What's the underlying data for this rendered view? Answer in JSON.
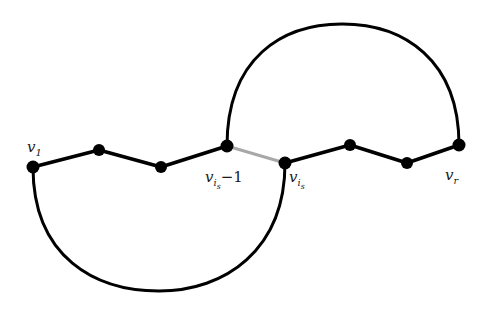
{
  "figure": {
    "background_color": "#ffffff",
    "width": 488,
    "height": 316,
    "edge_color": "#000000",
    "arc_color": "#000000",
    "highlight_edge_color": "#a8a8a8",
    "vertex_color": "#000000",
    "label_color": "#1a1a1a"
  },
  "vertices": [
    {
      "id": "v1",
      "x": 33,
      "y": 167,
      "r": 6.5,
      "label": "v",
      "sub": "1",
      "sub2": "",
      "tail": "",
      "label_x": 27,
      "label_y": 152,
      "labelled": true
    },
    {
      "id": "v2",
      "x": 99,
      "y": 150,
      "r": 6.0,
      "label": "",
      "sub": "",
      "sub2": "",
      "tail": "",
      "label_x": 0,
      "label_y": 0,
      "labelled": false
    },
    {
      "id": "v3",
      "x": 161,
      "y": 167,
      "r": 6.0,
      "label": "",
      "sub": "",
      "sub2": "",
      "tail": "",
      "label_x": 0,
      "label_y": 0,
      "labelled": false
    },
    {
      "id": "vis_1",
      "x": 227,
      "y": 146,
      "r": 6.5,
      "label": "v",
      "sub": "i",
      "sub2": "s",
      "tail": "−1",
      "label_x": 205,
      "label_y": 182,
      "labelled": true
    },
    {
      "id": "vis",
      "x": 285,
      "y": 163,
      "r": 6.5,
      "label": "v",
      "sub": "i",
      "sub2": "s",
      "tail": "",
      "label_x": 289,
      "label_y": 182,
      "labelled": true
    },
    {
      "id": "v6",
      "x": 350,
      "y": 145,
      "r": 6.0,
      "label": "",
      "sub": "",
      "sub2": "",
      "tail": "",
      "label_x": 0,
      "label_y": 0,
      "labelled": false
    },
    {
      "id": "v7",
      "x": 407,
      "y": 163,
      "r": 6.0,
      "label": "",
      "sub": "",
      "sub2": "",
      "tail": "",
      "label_x": 0,
      "label_y": 0,
      "labelled": false
    },
    {
      "id": "vr",
      "x": 459,
      "y": 145,
      "r": 6.5,
      "label": "v",
      "sub": "r",
      "sub2": "",
      "tail": "",
      "label_x": 445,
      "label_y": 180,
      "labelled": true
    }
  ],
  "edges": [
    {
      "id": "e1",
      "from": "v1",
      "to": "v2",
      "color": "#000000",
      "width": 3.6,
      "highlighted": false
    },
    {
      "id": "e2",
      "from": "v2",
      "to": "v3",
      "color": "#000000",
      "width": 3.6,
      "highlighted": false
    },
    {
      "id": "e3",
      "from": "v3",
      "to": "vis_1",
      "color": "#000000",
      "width": 3.6,
      "highlighted": false
    },
    {
      "id": "e4",
      "from": "vis_1",
      "to": "vis",
      "color": "#a8a8a8",
      "width": 3.0,
      "highlighted": true
    },
    {
      "id": "e5",
      "from": "vis",
      "to": "v6",
      "color": "#000000",
      "width": 3.6,
      "highlighted": false
    },
    {
      "id": "e6",
      "from": "v6",
      "to": "v7",
      "color": "#000000",
      "width": 3.6,
      "highlighted": false
    },
    {
      "id": "e7",
      "from": "v7",
      "to": "vr",
      "color": "#000000",
      "width": 3.6,
      "highlighted": false
    }
  ],
  "arcs": [
    {
      "id": "bottom-arc",
      "from": "v1",
      "to": "vis",
      "direction": "below",
      "path": "M 33 167 C 33 258, 96 291, 159 291 C 225 291, 285 250, 285 163",
      "color": "#000000",
      "width": 3.0
    },
    {
      "id": "top-arc",
      "from": "vis_1",
      "to": "vr",
      "direction": "above",
      "path": "M 227 146 C 227 58, 282 24, 342 24 C 404 24, 459 60, 459 145",
      "color": "#000000",
      "width": 3.0
    }
  ],
  "labels": {
    "v1": "v₁",
    "vis_minus_1": "v_{i_s−1}",
    "vis": "v_{i_s}",
    "vr": "v_r"
  }
}
